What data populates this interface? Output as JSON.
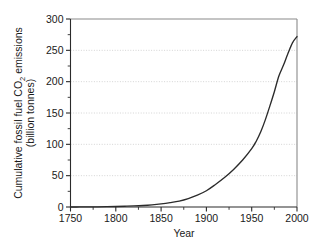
{
  "chart_data": {
    "type": "line",
    "title": "",
    "subtitle": "",
    "xlabel": "Year",
    "ylabel_line1": "Cumulative fossil fuel CO",
    "ylabel_line1_sub": "2",
    "ylabel_line1_tail": " emissions",
    "ylabel_line2": "(billion tonnes)",
    "ylabel_full": "Cumulative fossil fuel CO2 emissions (billion tonnes)",
    "xlim": [
      1750,
      2000
    ],
    "ylim": [
      0,
      300
    ],
    "xticks": [
      1750,
      1800,
      1850,
      1900,
      1950,
      2000
    ],
    "xtick_labels": [
      "1750",
      "1800",
      "1850",
      "1900",
      "1950",
      "2000"
    ],
    "yticks": [
      0,
      50,
      100,
      150,
      200,
      250,
      300
    ],
    "ytick_labels": [
      "0",
      "50",
      "100",
      "150",
      "200",
      "250",
      "300"
    ],
    "y_minor_ticks": [
      25,
      75,
      125,
      175,
      225,
      275
    ],
    "x_minor_ticks": [
      1775,
      1825,
      1875,
      1925,
      1975
    ],
    "grid": "horizontal-dotted",
    "legend": "none",
    "series": [
      {
        "name": "Cumulative fossil fuel CO2 emissions",
        "color": "#2b2b2b",
        "x": [
          1750,
          1760,
          1770,
          1780,
          1790,
          1800,
          1810,
          1820,
          1830,
          1840,
          1850,
          1860,
          1870,
          1880,
          1890,
          1900,
          1910,
          1920,
          1930,
          1940,
          1950,
          1955,
          1960,
          1965,
          1970,
          1975,
          1980,
          1985,
          1990,
          1995,
          2000
        ],
        "values": [
          0,
          0.1,
          0.2,
          0.3,
          0.5,
          0.8,
          1.2,
          1.7,
          2.4,
          3.5,
          5.0,
          7.0,
          9.5,
          13.5,
          19.0,
          26.0,
          36.0,
          47.0,
          60.0,
          75.0,
          93.0,
          105.0,
          120.0,
          139.0,
          161.0,
          184.0,
          209.0,
          226.0,
          245.0,
          262.0,
          272.0
        ]
      }
    ],
    "colors": {
      "curve": "#2b2b2b",
      "axis": "#2b2b2b",
      "frame": "#8a8a8a",
      "grid": "#c9c9c9",
      "background": "#ffffff",
      "text": "#1a1a1a"
    },
    "plot_area": {
      "left": 70.5,
      "right": 297.0,
      "top": 19.0,
      "bottom": 207.0
    }
  }
}
